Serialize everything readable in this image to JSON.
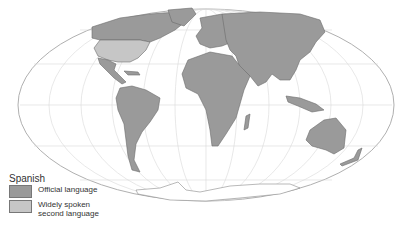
{
  "map": {
    "projection": "mollweide-ellipse",
    "colors": {
      "ocean": "#ffffff",
      "official": "#9a9a9a",
      "second": "#c6c6c6",
      "graticule": "#d4d4d4",
      "outline": "#b0b0b0",
      "border": "#6c6c6c"
    }
  },
  "legend": {
    "title": "Spanish",
    "items": [
      {
        "label": "Official language",
        "color": "#9a9a9a"
      },
      {
        "label": "Widely spoken\nsecond language",
        "color": "#c6c6c6"
      }
    ]
  }
}
